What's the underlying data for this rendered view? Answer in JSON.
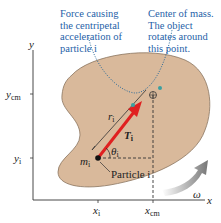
{
  "callouts": {
    "force": [
      "Force causing",
      "the centripetal",
      "acceleration of",
      "particle i"
    ],
    "center": [
      "Center of mass.",
      "The object",
      "rotates around",
      "this point."
    ]
  },
  "axes": {
    "x_label": "x",
    "y_label": "y",
    "y_cm": "y",
    "y_cm_sub": "cm",
    "y_i": "y",
    "y_i_sub": "i",
    "x_i": "x",
    "x_i_sub": "i",
    "x_cm": "x",
    "x_cm_sub": "cm"
  },
  "labels": {
    "r": "r",
    "r_sub": "i",
    "T": "T",
    "T_sub": "i",
    "theta": "θ",
    "theta_sub": "i",
    "m": "m",
    "m_sub": "i",
    "particle": "Particle i",
    "omega": "ω"
  },
  "colors": {
    "body_fill": "#d9b99b",
    "body_stroke": "#7a6a5a",
    "arrow_red": "#e02020",
    "callout_blue": "#1f5fa8",
    "dotted_teal": "#2a6a9a"
  }
}
